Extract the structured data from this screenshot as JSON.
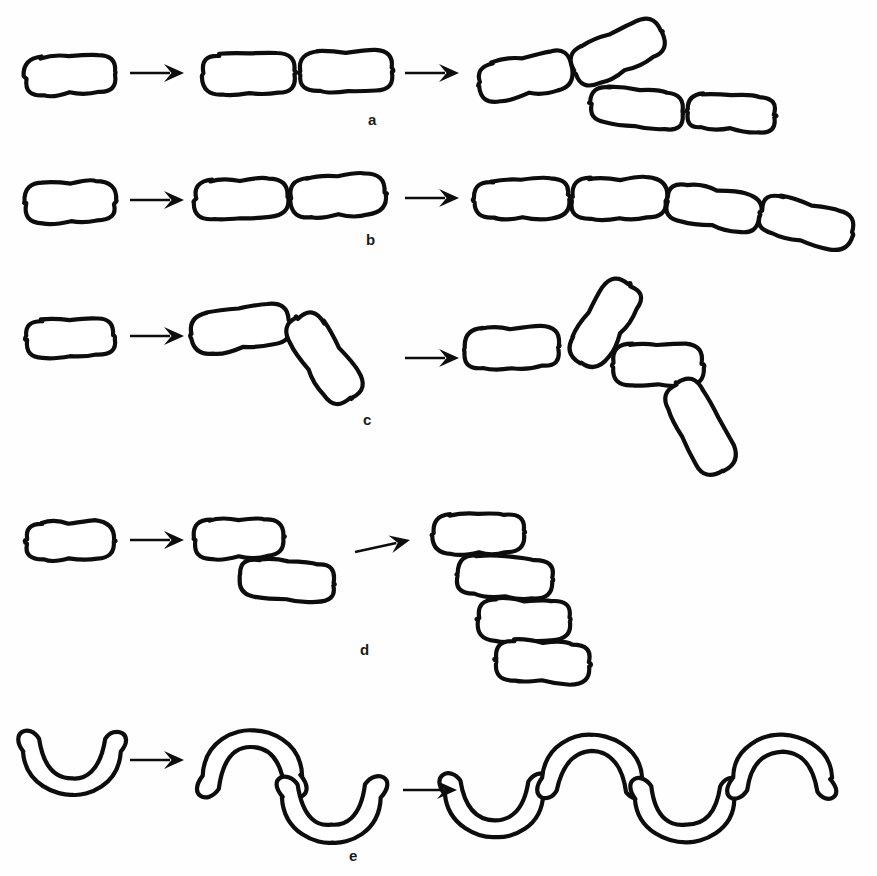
{
  "figure": {
    "background_color": "#fefefe",
    "ink_color": "#0d0d0d",
    "width": 877,
    "height": 876,
    "stage_count": 3,
    "arrow_symbol": "→"
  },
  "rows": [
    {
      "id": "a",
      "label": "a",
      "label_x": 368,
      "label_y": 112,
      "description": "Division in one plane with cells breaking apart into angled pairs and groups",
      "cell_shape": "rod",
      "stages": [
        {
          "index": 1,
          "cell_count": 1,
          "cells": [
            {
              "cx": 70,
              "cy": 75,
              "w": 90,
              "h": 38,
              "rot": -2
            }
          ]
        },
        {
          "index": 2,
          "cell_count": 2,
          "cells": [
            {
              "cx": 249,
              "cy": 74,
              "w": 92,
              "h": 40,
              "rot": -2
            },
            {
              "cx": 347,
              "cy": 71,
              "w": 92,
              "h": 40,
              "rot": -2
            }
          ]
        },
        {
          "index": 3,
          "cell_count": 4,
          "cells": [
            {
              "cx": 525,
              "cy": 76,
              "w": 93,
              "h": 38,
              "rot": -11
            },
            {
              "cx": 618,
              "cy": 52,
              "w": 95,
              "h": 40,
              "rot": -25
            },
            {
              "cx": 637,
              "cy": 108,
              "w": 92,
              "h": 36,
              "rot": 6
            },
            {
              "cx": 731,
              "cy": 113,
              "w": 88,
              "h": 34,
              "rot": 3
            }
          ]
        }
      ],
      "arrows": [
        {
          "x1": 130,
          "y1": 73,
          "x2": 184,
          "y2": 73
        },
        {
          "x1": 405,
          "y1": 73,
          "x2": 459,
          "y2": 73
        }
      ]
    },
    {
      "id": "b",
      "label": "b",
      "label_x": 366,
      "label_y": 232,
      "description": "Division in one plane with cells remaining attached forming a chain",
      "cell_shape": "rod",
      "stages": [
        {
          "index": 1,
          "cell_count": 1,
          "cells": [
            {
              "cx": 70,
              "cy": 202,
              "w": 90,
              "h": 40,
              "rot": -1
            }
          ]
        },
        {
          "index": 2,
          "cell_count": 2,
          "cells": [
            {
              "cx": 241,
              "cy": 199,
              "w": 92,
              "h": 38,
              "rot": -2
            },
            {
              "cx": 338,
              "cy": 196,
              "w": 94,
              "h": 40,
              "rot": -4
            }
          ]
        },
        {
          "index": 3,
          "cell_count": 4,
          "cells": [
            {
              "cx": 522,
              "cy": 199,
              "w": 94,
              "h": 38,
              "rot": -2
            },
            {
              "cx": 619,
              "cy": 198,
              "w": 94,
              "h": 40,
              "rot": 0
            },
            {
              "cx": 714,
              "cy": 208,
              "w": 94,
              "h": 38,
              "rot": 10
            },
            {
              "cx": 806,
              "cy": 223,
              "w": 94,
              "h": 38,
              "rot": 14
            }
          ]
        }
      ],
      "arrows": [
        {
          "x1": 130,
          "y1": 200,
          "x2": 184,
          "y2": 200
        },
        {
          "x1": 405,
          "y1": 198,
          "x2": 459,
          "y2": 198
        }
      ]
    },
    {
      "id": "c",
      "label": "c",
      "label_x": 363,
      "label_y": 412,
      "description": "Snapping division producing angular V-forms",
      "cell_shape": "rod",
      "stages": [
        {
          "index": 1,
          "cell_count": 1,
          "cells": [
            {
              "cx": 70,
              "cy": 338,
              "w": 88,
              "h": 36,
              "rot": -1
            }
          ]
        },
        {
          "index": 2,
          "cell_count": 2,
          "cells": [
            {
              "cx": 240,
              "cy": 329,
              "w": 96,
              "h": 40,
              "rot": -8
            },
            {
              "cx": 324,
              "cy": 358,
              "w": 96,
              "h": 40,
              "rot": 56
            }
          ]
        },
        {
          "index": 3,
          "cell_count": 4,
          "cells": [
            {
              "cx": 512,
              "cy": 348,
              "w": 94,
              "h": 40,
              "rot": -2
            },
            {
              "cx": 605,
              "cy": 323,
              "w": 92,
              "h": 40,
              "rot": -58
            },
            {
              "cx": 658,
              "cy": 365,
              "w": 90,
              "h": 40,
              "rot": 0
            },
            {
              "cx": 700,
              "cy": 427,
              "w": 98,
              "h": 40,
              "rot": 62
            }
          ]
        }
      ],
      "arrows": [
        {
          "x1": 130,
          "y1": 336,
          "x2": 184,
          "y2": 336
        },
        {
          "x1": 405,
          "y1": 358,
          "x2": 459,
          "y2": 358
        }
      ]
    },
    {
      "id": "d",
      "label": "d",
      "label_x": 360,
      "label_y": 642,
      "description": "Slipped or palisade arrangement with cells lying side by side",
      "cell_shape": "rod",
      "stages": [
        {
          "index": 1,
          "cell_count": 1,
          "cells": [
            {
              "cx": 70,
              "cy": 541,
              "w": 88,
              "h": 38,
              "rot": -1
            }
          ]
        },
        {
          "index": 2,
          "cell_count": 2,
          "cells": [
            {
              "cx": 239,
              "cy": 538,
              "w": 90,
              "h": 38,
              "rot": -2
            },
            {
              "cx": 288,
              "cy": 580,
              "w": 94,
              "h": 38,
              "rot": 4
            }
          ]
        },
        {
          "index": 3,
          "cell_count": 4,
          "cells": [
            {
              "cx": 478,
              "cy": 534,
              "w": 90,
              "h": 40,
              "rot": -1
            },
            {
              "cx": 505,
              "cy": 577,
              "w": 94,
              "h": 40,
              "rot": 4
            },
            {
              "cx": 524,
              "cy": 620,
              "w": 92,
              "h": 40,
              "rot": 0
            },
            {
              "cx": 543,
              "cy": 662,
              "w": 94,
              "h": 40,
              "rot": 3
            }
          ]
        }
      ],
      "arrows": [
        {
          "x1": 130,
          "y1": 540,
          "x2": 184,
          "y2": 540
        },
        {
          "x1": 355,
          "y1": 552,
          "x2": 410,
          "y2": 540
        }
      ]
    },
    {
      "id": "e",
      "label": "e",
      "label_x": 349,
      "label_y": 848,
      "description": "Division of curved vibrio cells forming S-shaped and wavy chains",
      "cell_shape": "curved",
      "stages": [
        {
          "index": 1,
          "cell_count": 1,
          "cells": [
            {
              "cx": 72,
              "cy": 758,
              "w": 96,
              "h": 44,
              "rot": 0,
              "flip": false
            }
          ]
        },
        {
          "index": 2,
          "cell_count": 2,
          "cells": [
            {
              "cx": 252,
              "cy": 769,
              "w": 98,
              "h": 46,
              "rot": 0,
              "flip": true
            },
            {
              "cx": 332,
              "cy": 804,
              "w": 98,
              "h": 46,
              "rot": 0,
              "flip": false
            }
          ]
        },
        {
          "index": 3,
          "cell_count": 4,
          "cells": [
            {
              "cx": 495,
              "cy": 800,
              "w": 98,
              "h": 44,
              "rot": 0,
              "flip": false
            },
            {
              "cx": 592,
              "cy": 772,
              "w": 98,
              "h": 44,
              "rot": 0,
              "flip": true
            },
            {
              "cx": 685,
              "cy": 805,
              "w": 98,
              "h": 44,
              "rot": 0,
              "flip": false
            },
            {
              "cx": 782,
              "cy": 772,
              "w": 98,
              "h": 44,
              "rot": 0,
              "flip": true
            }
          ]
        }
      ],
      "arrows": [
        {
          "x1": 130,
          "y1": 760,
          "x2": 184,
          "y2": 760
        },
        {
          "x1": 403,
          "y1": 790,
          "x2": 457,
          "y2": 790
        }
      ]
    }
  ]
}
